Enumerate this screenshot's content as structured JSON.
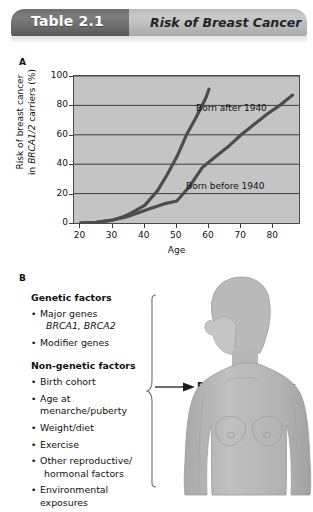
{
  "header": {
    "tab_label": "Table 2.1",
    "title": "Risk of Breast Cancer"
  },
  "panels": {
    "a_letter": "A",
    "b_letter": "B"
  },
  "chart_data": {
    "type": "line",
    "title": "Risk of Breast Cancer",
    "xlabel": "Age",
    "ylabel": "Risk of breast cancer in BRCA1/2 carriers (%)",
    "ylabel_part1": "Risk of breast cancer",
    "ylabel_part2_pre": "in ",
    "ylabel_part2_italic": "BRCA1/2",
    "ylabel_part2_post": " carriers (%)",
    "xlim": [
      18,
      88
    ],
    "ylim": [
      0,
      100
    ],
    "xticks": [
      20,
      30,
      40,
      50,
      60,
      70,
      80
    ],
    "yticks": [
      0,
      20,
      40,
      60,
      80,
      100
    ],
    "grid": true,
    "legend_position": "inline-annotations",
    "series": [
      {
        "name": "Born after 1940",
        "label": "Born after 1940",
        "x": [
          20,
          25,
          30,
          33,
          36,
          40,
          44,
          47,
          50,
          53,
          56,
          59,
          60
        ],
        "values": [
          0,
          0.5,
          2,
          4,
          7,
          12,
          22,
          33,
          45,
          60,
          72,
          85,
          91
        ]
      },
      {
        "name": "Born before 1940",
        "label": "Born before 1940",
        "x": [
          20,
          25,
          30,
          34,
          38,
          42,
          46,
          50,
          54,
          58,
          62,
          66,
          70,
          74,
          78,
          82,
          86
        ],
        "values": [
          0,
          0.5,
          2,
          4,
          7,
          10,
          13,
          15,
          25,
          38,
          45,
          52,
          60,
          67,
          74,
          80,
          87
        ]
      }
    ]
  },
  "panel_b": {
    "genetic_heading": "Genetic factors",
    "genetic_items": [
      {
        "text": "Major genes",
        "sub": "BRCA1, BRCA2"
      },
      {
        "text": "Modifier genes"
      }
    ],
    "nongenetic_heading": "Non-genetic factors",
    "nongenetic_items": [
      {
        "text": "Birth cohort"
      },
      {
        "text": "Age at menarche/puberty"
      },
      {
        "text": "Weight/diet"
      },
      {
        "text": "Exercise"
      },
      {
        "text": "Other reproductive/",
        "cont": "hormonal factors"
      },
      {
        "text": "Environmental exposures"
      }
    ],
    "outcome_label": "Breast cancer risk",
    "figure_name": "female-torso-silhouette"
  },
  "colors": {
    "plot_background": "#c4c4c4",
    "axis": "#3c3c3c",
    "curve": "#4d4d4d",
    "header_tab": "#6e6e6e",
    "header_band": "#bdbdbd",
    "figure_fill": "#b6b6b6"
  }
}
